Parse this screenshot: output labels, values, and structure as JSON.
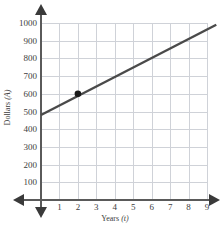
{
  "chart_data": {
    "type": "line",
    "title": "",
    "xlabel": "Years (t)",
    "ylabel": "Dollars (A)",
    "xlabel_text": "Years",
    "xlabel_var": "(t)",
    "ylabel_text": "Dollars",
    "ylabel_var": "(A)",
    "xlim": [
      0,
      9.5
    ],
    "ylim": [
      0,
      1050
    ],
    "grid": true,
    "legend": "none",
    "xticks": [
      1,
      2,
      3,
      4,
      5,
      6,
      7,
      8,
      9
    ],
    "yticks": [
      100,
      200,
      300,
      400,
      500,
      600,
      700,
      800,
      900,
      1000
    ],
    "series": [
      {
        "name": "account-value",
        "kind": "line",
        "x": [
          0,
          9.5
        ],
        "values": [
          480,
          990
        ],
        "slope": 53.7,
        "intercept": 480,
        "color": "#4a4a4a"
      }
    ],
    "points": [
      {
        "label": "",
        "x": 2,
        "y": 600,
        "color": "#1a1a1a"
      }
    ]
  },
  "axes": {
    "y_axis_name": "dollars-axis",
    "x_axis_name": "years-axis"
  }
}
